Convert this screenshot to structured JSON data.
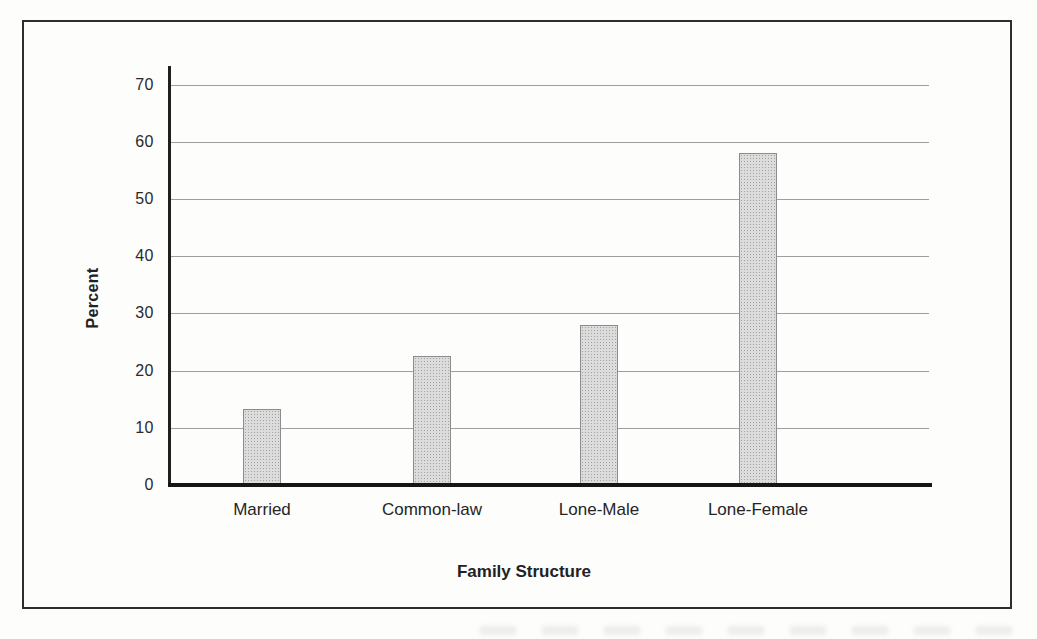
{
  "figure": {
    "background": "#fdfdfc",
    "frame_color": "#2e2e2e"
  },
  "chart_data": {
    "type": "bar",
    "title": "",
    "categories": [
      "Married",
      "Common-law",
      "Lone-Male",
      "Lone-Female"
    ],
    "values": [
      13.3,
      22.5,
      28,
      58
    ],
    "xlabel": "Family Structure",
    "ylabel": "Percent",
    "ylim": [
      0,
      70
    ],
    "yticks": [
      0,
      10,
      20,
      30,
      40,
      50,
      60,
      70
    ],
    "grid": true,
    "legend": false,
    "bar_color": "#dcdcdc",
    "bar_border_color": "#8c8c8c",
    "gridline_color": "#8d8d8d",
    "axis_color": "#1f1f1f",
    "layout": {
      "baseline_y": 463,
      "px_per_unit": 5.72,
      "bar_width": 38,
      "bar_centers": [
        238,
        408,
        575,
        734
      ],
      "grid_left": 147,
      "grid_width": 758
    }
  }
}
